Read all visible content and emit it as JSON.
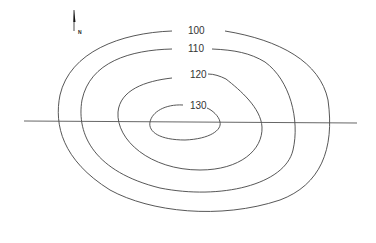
{
  "diagram": {
    "type": "contour-map",
    "north_arrow": {
      "label": "N"
    },
    "contours": [
      {
        "elevation": "100",
        "label": "100"
      },
      {
        "elevation": "110",
        "label": "110"
      },
      {
        "elevation": "120",
        "label": "120"
      },
      {
        "elevation": "130",
        "label": "130"
      }
    ],
    "cross_section_line": {
      "present": true
    },
    "colors": {
      "line": "#444444",
      "background": "#ffffff"
    }
  }
}
